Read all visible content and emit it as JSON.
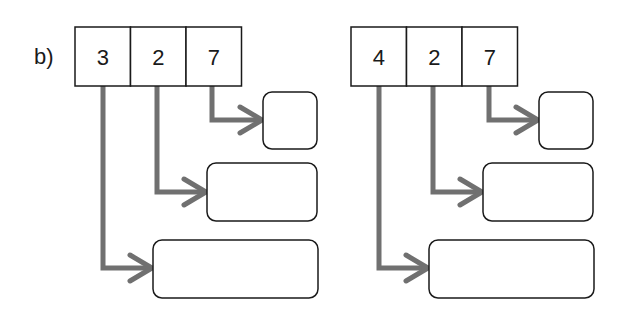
{
  "label": "b)",
  "colors": {
    "outline": "#1a1a1a",
    "arrow": "#707070",
    "background": "#ffffff"
  },
  "diagrams": [
    {
      "name": "left",
      "array": {
        "x": 75,
        "y": 27,
        "cell_width": 55.5,
        "height": 59,
        "values": [
          "3",
          "2",
          "7"
        ]
      },
      "targets": [
        {
          "x": 153,
          "y": 240,
          "w": 165,
          "h": 58
        },
        {
          "x": 207,
          "y": 163,
          "w": 110,
          "h": 58
        },
        {
          "x": 263,
          "y": 92,
          "w": 54,
          "h": 57
        }
      ],
      "pointers": [
        {
          "from_x": 103,
          "turn_y": 268,
          "to_x": 153
        },
        {
          "from_x": 157,
          "turn_y": 192,
          "to_x": 207
        },
        {
          "from_x": 212,
          "turn_y": 120,
          "to_x": 263
        }
      ]
    },
    {
      "name": "right",
      "array": {
        "x": 351,
        "y": 27,
        "cell_width": 55.5,
        "height": 59,
        "values": [
          "4",
          "2",
          "7"
        ]
      },
      "targets": [
        {
          "x": 429,
          "y": 240,
          "w": 165,
          "h": 58
        },
        {
          "x": 483,
          "y": 163,
          "w": 110,
          "h": 58
        },
        {
          "x": 539,
          "y": 92,
          "w": 54,
          "h": 57
        }
      ],
      "pointers": [
        {
          "from_x": 379,
          "turn_y": 268,
          "to_x": 429
        },
        {
          "from_x": 433,
          "turn_y": 192,
          "to_x": 483
        },
        {
          "from_x": 489,
          "turn_y": 120,
          "to_x": 539
        }
      ]
    }
  ]
}
